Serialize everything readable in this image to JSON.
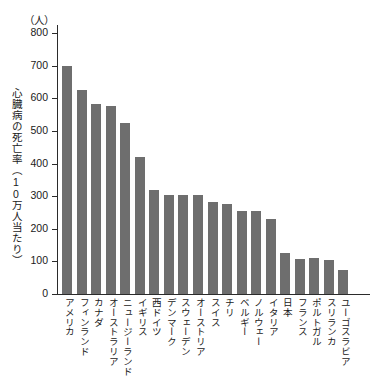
{
  "chart_data": {
    "type": "bar",
    "title": "",
    "subtitle": "",
    "xlabel": "",
    "ylabel": "心臓病の死亡率（10万人当たり）",
    "y_unit": "（人）",
    "ylim": [
      0,
      800
    ],
    "y_ticks": [
      0,
      100,
      200,
      300,
      400,
      500,
      600,
      700,
      800
    ],
    "grid": false,
    "legend": null,
    "bar_color": "#6e6e6e",
    "axis_color": "#2b2b2b",
    "categories": [
      "アメリカ",
      "フィンランド",
      "カナダ",
      "オーストラリア",
      "ニュージーランド",
      "イギリス",
      "西ドイツ",
      "デンマーク",
      "スウェーデン",
      "オーストリア",
      "スイス",
      "チリ",
      "ベルギー",
      "ノルウェー",
      "イタリア",
      "日本",
      "フランス",
      "ポルトガル",
      "スリランカ",
      "ユーゴスラビア"
    ],
    "values": [
      700,
      625,
      583,
      575,
      525,
      420,
      320,
      304,
      304,
      305,
      282,
      275,
      253,
      254,
      230,
      125,
      108,
      109,
      103,
      75
    ]
  }
}
